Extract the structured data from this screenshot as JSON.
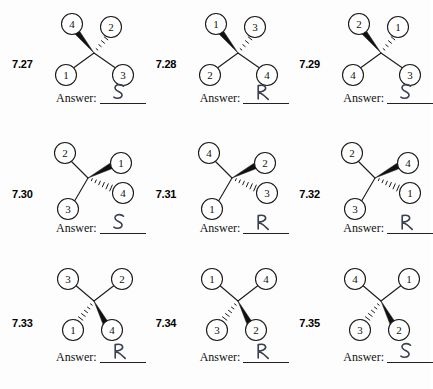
{
  "worksheet": {
    "answer_label": "Answer:",
    "geometries": {
      "wedge_up_left": "bold wedge to upper-left, hashed wedge to upper-right, plain bonds to lower-left and lower-right",
      "wedge_right": "plain bonds to upper-left and lower-left, bold wedge to right, hashed wedge to lower-right",
      "wedge_down_right": "plain bonds to upper-left and upper-right, hashed wedge to lower-left, bold wedge to lower-right"
    },
    "problems": [
      {
        "number": "7.27",
        "geometry": "wedge_up_left",
        "substituents": {
          "up_left": "4",
          "up_right": "2",
          "down_left": "1",
          "down_right": "3"
        },
        "answer": "S"
      },
      {
        "number": "7.28",
        "geometry": "wedge_up_left",
        "substituents": {
          "up_left": "1",
          "up_right": "3",
          "down_left": "2",
          "down_right": "4"
        },
        "answer": "R"
      },
      {
        "number": "7.29",
        "geometry": "wedge_up_left",
        "substituents": {
          "up_left": "2",
          "up_right": "1",
          "down_left": "4",
          "down_right": "3"
        },
        "answer": "S"
      },
      {
        "number": "7.30",
        "geometry": "wedge_right",
        "substituents": {
          "up_left": "2",
          "right": "1",
          "down_right": "4",
          "down_left": "3"
        },
        "answer": "S"
      },
      {
        "number": "7.31",
        "geometry": "wedge_right",
        "substituents": {
          "up_left": "4",
          "right": "2",
          "down_right": "3",
          "down_left": "1"
        },
        "answer": "R"
      },
      {
        "number": "7.32",
        "geometry": "wedge_right",
        "substituents": {
          "up_left": "2",
          "right": "4",
          "down_right": "1",
          "down_left": "3"
        },
        "answer": "R"
      },
      {
        "number": "7.33",
        "geometry": "wedge_down_right",
        "substituents": {
          "up_left": "3",
          "up_right": "2",
          "down_left": "1",
          "down_right": "4"
        },
        "answer": "R"
      },
      {
        "number": "7.34",
        "geometry": "wedge_down_right",
        "substituents": {
          "up_left": "1",
          "up_right": "4",
          "down_left": "3",
          "down_right": "2"
        },
        "answer": "R"
      },
      {
        "number": "7.35",
        "geometry": "wedge_down_right",
        "substituents": {
          "up_left": "4",
          "up_right": "1",
          "down_left": "3",
          "down_right": "2"
        },
        "answer": "S"
      }
    ]
  }
}
